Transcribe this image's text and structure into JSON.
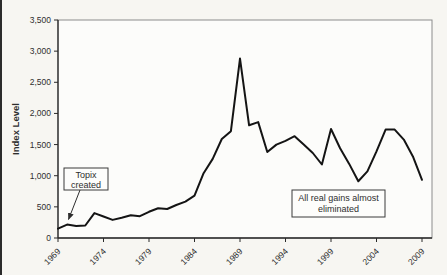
{
  "figure": {
    "background": "#f7f6f2",
    "plot_fill": "#fcfcfa",
    "border_color": "#8c8c8c",
    "axis_color": "#2a2a2a",
    "line_color": "#141414",
    "text_color": "#2e2e2e"
  },
  "y_axis": {
    "title": "Index Level",
    "tick_labels": [
      "0",
      "500",
      "1,000",
      "1,500",
      "2,000",
      "2,500",
      "3,000",
      "3,500"
    ],
    "min": 0,
    "max": 3500,
    "step": 500
  },
  "x_axis": {
    "tick_labels": [
      "1969",
      "1974",
      "1979",
      "1984",
      "1989",
      "1994",
      "1999",
      "2004",
      "2009"
    ]
  },
  "annotations": [
    {
      "id": "topix-created",
      "lines": [
        "Topix",
        "created"
      ]
    },
    {
      "id": "real-gains-eliminated",
      "lines": [
        "All real gains almost",
        "eliminated"
      ]
    }
  ],
  "chart_data": {
    "type": "line",
    "title": "",
    "xlabel": "",
    "ylabel": "Index Level",
    "ylim": [
      0,
      3500
    ],
    "x_range": [
      1969,
      2009
    ],
    "grid": false,
    "legend": null,
    "years": [
      1969,
      1970,
      1971,
      1972,
      1973,
      1974,
      1975,
      1976,
      1977,
      1978,
      1979,
      1980,
      1981,
      1982,
      1983,
      1984,
      1985,
      1986,
      1987,
      1988,
      1989,
      1990,
      1991,
      1992,
      1993,
      1994,
      1995,
      1996,
      1997,
      1998,
      1999,
      2000,
      2001,
      2002,
      2003,
      2004,
      2005,
      2006,
      2007,
      2008,
      2009
    ],
    "values": [
      150,
      215,
      195,
      200,
      400,
      345,
      290,
      325,
      365,
      350,
      420,
      478,
      465,
      530,
      585,
      680,
      1040,
      1270,
      1590,
      1715,
      2880,
      1810,
      1860,
      1380,
      1500,
      1560,
      1635,
      1500,
      1365,
      1180,
      1750,
      1440,
      1190,
      910,
      1070,
      1390,
      1740,
      1740,
      1580,
      1310,
      935
    ],
    "annotations": [
      {
        "text": "Topix created",
        "target_year": 1970
      },
      {
        "text": "All real gains almost eliminated"
      }
    ]
  }
}
